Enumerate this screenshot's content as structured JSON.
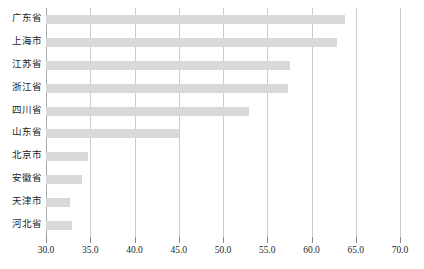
{
  "chart_data": {
    "type": "bar",
    "orientation": "horizontal",
    "title": "",
    "subtitle": "",
    "xlabel": "",
    "ylabel": "",
    "xlim": [
      30.0,
      70.0
    ],
    "xticks": [
      "30.0",
      "35.0",
      "40.0",
      "45.0",
      "50.0",
      "55.0",
      "60.0",
      "65.0",
      "70.0"
    ],
    "xtick_values": [
      30.0,
      35.0,
      40.0,
      45.0,
      50.0,
      55.0,
      60.0,
      65.0,
      70.0
    ],
    "grid": "vertical",
    "legend": "none",
    "bar_color": "#d9d9d9",
    "gridline_color": "#cccccc",
    "background_color": "#ffffff",
    "categories": [
      "广东省",
      "上海市",
      "江苏省",
      "浙江省",
      "四川省",
      "山东省",
      "北京市",
      "安徽省",
      "天津市",
      "河北省"
    ],
    "values": [
      63.8,
      62.9,
      57.6,
      57.4,
      52.9,
      45.0,
      34.8,
      34.1,
      32.7,
      32.9
    ]
  }
}
